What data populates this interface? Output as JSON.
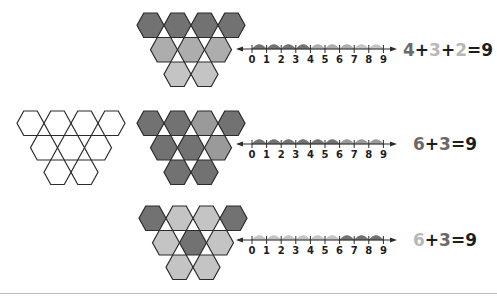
{
  "colors": {
    "outline": "#2b2b2b",
    "dark": "#727272",
    "medium": "#9a9a9a",
    "mid_light": "#adadad",
    "light": "#c4c4c4",
    "text_dark": "#1e1e1e",
    "text_mid": "#6a6a6a",
    "text_light": "#b8b8b8"
  },
  "outline_group": {
    "origin": [
      17,
      111
    ],
    "fills": [
      [
        "none",
        "none",
        "none",
        "none"
      ],
      [
        "none",
        "none",
        "none"
      ],
      [
        "none",
        "none"
      ]
    ]
  },
  "rows": [
    {
      "id": "row-top",
      "hex_origin": [
        137,
        13
      ],
      "fills": [
        [
          "dark",
          "dark",
          "dark",
          "dark"
        ],
        [
          "mid_light",
          "mid_light",
          "mid_light"
        ],
        [
          "light",
          "light"
        ]
      ],
      "number_line": {
        "y": 49,
        "ticks": [
          "0",
          "1",
          "2",
          "3",
          "4",
          "5",
          "6",
          "7",
          "8",
          "9"
        ],
        "arcs": [
          "dark",
          "dark",
          "dark",
          "dark",
          "mid_light",
          "mid_light",
          "mid_light",
          "light",
          "light"
        ]
      },
      "equation": {
        "x": 403,
        "y": 40,
        "parts": [
          {
            "text": "4",
            "color": "text_mid"
          },
          {
            "text": "+",
            "color": "text_dark"
          },
          {
            "text": "3",
            "color": "text_light"
          },
          {
            "text": "+",
            "color": "text_dark"
          },
          {
            "text": "2",
            "color": "text_light"
          },
          {
            "text": "=9",
            "color": "text_dark"
          }
        ]
      }
    },
    {
      "id": "row-middle",
      "hex_origin": [
        137,
        111
      ],
      "fills": [
        [
          "dark",
          "dark",
          "medium",
          "dark"
        ],
        [
          "dark",
          "dark",
          "medium"
        ],
        [
          "dark",
          "dark"
        ]
      ],
      "number_line": {
        "y": 144,
        "ticks": [
          "0",
          "1",
          "2",
          "3",
          "4",
          "5",
          "6",
          "7",
          "8",
          "9"
        ],
        "arcs": [
          "dark",
          "dark",
          "dark",
          "dark",
          "dark",
          "dark",
          "medium",
          "medium",
          "medium"
        ]
      },
      "equation": {
        "x": 413,
        "y": 134,
        "parts": [
          {
            "text": "6",
            "color": "text_mid"
          },
          {
            "text": "+",
            "color": "text_dark"
          },
          {
            "text": "3",
            "color": "text_mid"
          },
          {
            "text": "=9",
            "color": "text_dark"
          }
        ]
      }
    },
    {
      "id": "row-bottom",
      "hex_origin": [
        139,
        206
      ],
      "fills": [
        [
          "dark",
          "light",
          "light",
          "dark"
        ],
        [
          "light",
          "dark",
          "light"
        ],
        [
          "light",
          "light"
        ]
      ],
      "number_line": {
        "y": 240,
        "ticks": [
          "0",
          "1",
          "2",
          "3",
          "4",
          "5",
          "6",
          "7",
          "8",
          "9"
        ],
        "arcs": [
          "light",
          "light",
          "light",
          "light",
          "light",
          "light",
          "dark",
          "dark",
          "dark"
        ]
      },
      "equation": {
        "x": 413,
        "y": 230,
        "parts": [
          {
            "text": "6",
            "color": "text_light"
          },
          {
            "text": "+",
            "color": "text_dark"
          },
          {
            "text": "3",
            "color": "text_mid"
          },
          {
            "text": "=9",
            "color": "text_dark"
          }
        ]
      }
    }
  ]
}
